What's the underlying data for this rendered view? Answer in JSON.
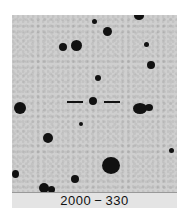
{
  "chart": {
    "label": "2000 − 330"
  },
  "colors": {
    "sky": "#cfcfcf",
    "stars": "#111111",
    "label_band": "#e4e4e4"
  }
}
